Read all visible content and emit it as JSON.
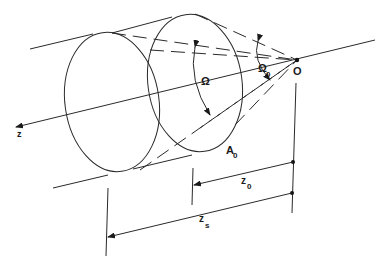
{
  "figure": {
    "labels": {
      "origin": "O",
      "axis": "z",
      "omega": "Ω",
      "omega0_main": "Ω",
      "omega0_sub": "0",
      "area_main": "A",
      "area_sub": "0",
      "z0_main": "z",
      "z0_sub": "0",
      "zs_main": "z",
      "zs_sub": "s"
    }
  }
}
